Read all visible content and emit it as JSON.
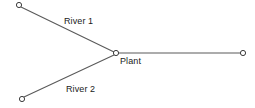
{
  "diagram": {
    "type": "network-graph",
    "background_color": "#ffffff",
    "edge_color": "#5a5a5a",
    "node_fill_color": "#ffffff",
    "node_stroke_color": "#3c3c3c",
    "label_color": "#1a1a1a",
    "width": 255,
    "height": 108,
    "nodes": [
      {
        "id": "river1_source",
        "label": "",
        "x": 19,
        "y": 5,
        "r": 2.6
      },
      {
        "id": "river2_source",
        "label": "",
        "x": 22,
        "y": 99,
        "r": 2.6
      },
      {
        "id": "plant",
        "label": "Plant",
        "x": 116,
        "y": 53,
        "r": 2.6
      },
      {
        "id": "outlet",
        "label": "",
        "x": 243,
        "y": 53,
        "r": 2.6
      }
    ],
    "edges": [
      {
        "id": "edge-river-1",
        "label": "River 1",
        "from": "river1_source",
        "to": "plant",
        "x1": 21,
        "y1": 7,
        "x2": 114,
        "y2": 52
      },
      {
        "id": "edge-river-2",
        "label": "River 2",
        "from": "river2_source",
        "to": "plant",
        "x1": 24,
        "y1": 97,
        "x2": 114,
        "y2": 55
      },
      {
        "id": "edge-outflow",
        "label": "",
        "from": "plant",
        "to": "outlet",
        "x1": 119,
        "y1": 53,
        "x2": 241,
        "y2": 53
      }
    ],
    "labels": {
      "river_1": "River 1",
      "river_2": "River 2",
      "plant": "Plant"
    }
  }
}
